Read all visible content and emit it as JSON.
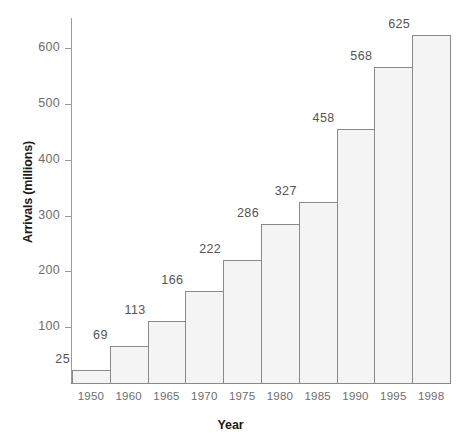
{
  "chart_data": {
    "type": "bar",
    "title": "",
    "subtitle": "",
    "xlabel": "Year",
    "ylabel": "Arrivals (millions)",
    "categories": [
      "1950",
      "1960",
      "1965",
      "1970",
      "1975",
      "1980",
      "1985",
      "1990",
      "1995",
      "1998"
    ],
    "values": [
      25,
      69,
      113,
      166,
      222,
      286,
      327,
      458,
      568,
      625
    ],
    "value_labels": [
      "25",
      "69",
      "113",
      "166",
      "222",
      "286",
      "327",
      "458",
      "568",
      "625"
    ],
    "ylim": [
      0,
      660
    ],
    "y_ticks": [
      100,
      200,
      300,
      400,
      500,
      600
    ],
    "y_tick_labels": [
      "100",
      "200",
      "300",
      "400",
      "500",
      "600"
    ],
    "grid": false,
    "legend": false,
    "legend_position": "none",
    "series": [
      {
        "name": "International tourist arrivals",
        "values": [
          25,
          69,
          113,
          166,
          222,
          286,
          327,
          458,
          568,
          625
        ]
      }
    ],
    "colors": {
      "bar_fill": "#f4f4f4",
      "bar_stroke": "#8a8a8a",
      "axis": "#9a9a9a",
      "tick_text": "#6d6d6d",
      "value_text": "#555555",
      "title_text": "#1a1a1a",
      "background": "#ffffff"
    }
  }
}
